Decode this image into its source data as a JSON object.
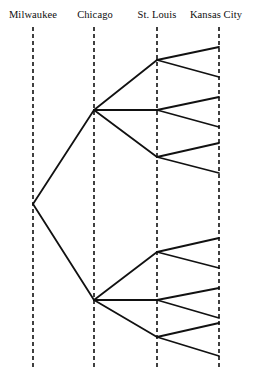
{
  "figure": {
    "type": "tree-diagram",
    "background": "#ffffff",
    "stroke_color": "#111111",
    "width": 254,
    "height": 370
  },
  "columns": [
    {
      "id": "milwaukee",
      "label": "Milwaukee",
      "x": 33,
      "label_x": 33,
      "label_y": 10
    },
    {
      "id": "chicago",
      "label": "Chicago",
      "x": 94,
      "label_x": 95,
      "label_y": 10
    },
    {
      "id": "stlouis",
      "label": "St. Louis",
      "x": 157,
      "label_x": 157,
      "label_y": 10
    },
    {
      "id": "kansascity",
      "label": "Kansas City",
      "x": 219,
      "label_x": 216,
      "label_y": 10
    }
  ],
  "axis_lines": {
    "style": "dashed",
    "y_top": 27,
    "y_bottom": 369,
    "dash": "4 3",
    "width": 1.6,
    "color": "#111111"
  },
  "nodes": {
    "root": [
      {
        "id": "m0",
        "x": 33,
        "y": 204
      }
    ],
    "chicago": [
      {
        "id": "c1",
        "x": 94,
        "y": 110
      },
      {
        "id": "c2",
        "x": 94,
        "y": 300
      }
    ],
    "stlouis": [
      {
        "id": "s1",
        "x": 157,
        "y": 60,
        "parent": "c1"
      },
      {
        "id": "s2",
        "x": 157,
        "y": 110,
        "parent": "c1"
      },
      {
        "id": "s3",
        "x": 157,
        "y": 157,
        "parent": "c1"
      },
      {
        "id": "s4",
        "x": 157,
        "y": 252,
        "parent": "c2"
      },
      {
        "id": "s5",
        "x": 157,
        "y": 300,
        "parent": "c2"
      },
      {
        "id": "s6",
        "x": 157,
        "y": 337,
        "parent": "c2"
      }
    ],
    "kansascity": [
      {
        "id": "k1",
        "x": 219,
        "y": 47,
        "parent": "s1"
      },
      {
        "id": "k2",
        "x": 219,
        "y": 77,
        "parent": "s1"
      },
      {
        "id": "k3",
        "x": 219,
        "y": 97,
        "parent": "s2"
      },
      {
        "id": "k4",
        "x": 219,
        "y": 127,
        "parent": "s2"
      },
      {
        "id": "k5",
        "x": 219,
        "y": 143,
        "parent": "s3"
      },
      {
        "id": "k6",
        "x": 219,
        "y": 173,
        "parent": "s3"
      },
      {
        "id": "k7",
        "x": 219,
        "y": 238,
        "parent": "s4"
      },
      {
        "id": "k8",
        "x": 219,
        "y": 268,
        "parent": "s4"
      },
      {
        "id": "k9",
        "x": 219,
        "y": 288,
        "parent": "s5"
      },
      {
        "id": "k10",
        "x": 219,
        "y": 318,
        "parent": "s5"
      },
      {
        "id": "k11",
        "x": 219,
        "y": 323,
        "parent": "s6"
      },
      {
        "id": "k12",
        "x": 219,
        "y": 356,
        "parent": "s6"
      }
    ]
  },
  "edges": [
    {
      "from": "m0",
      "to": "c1",
      "x1": 33,
      "y1": 204,
      "x2": 94,
      "y2": 110
    },
    {
      "from": "m0",
      "to": "c2",
      "x1": 33,
      "y1": 204,
      "x2": 94,
      "y2": 300
    },
    {
      "from": "c1",
      "to": "s1",
      "x1": 94,
      "y1": 110,
      "x2": 157,
      "y2": 60
    },
    {
      "from": "c1",
      "to": "s2",
      "x1": 94,
      "y1": 110,
      "x2": 157,
      "y2": 110
    },
    {
      "from": "c1",
      "to": "s3",
      "x1": 94,
      "y1": 110,
      "x2": 157,
      "y2": 157
    },
    {
      "from": "c2",
      "to": "s4",
      "x1": 94,
      "y1": 300,
      "x2": 157,
      "y2": 252
    },
    {
      "from": "c2",
      "to": "s5",
      "x1": 94,
      "y1": 300,
      "x2": 157,
      "y2": 300
    },
    {
      "from": "c2",
      "to": "s6",
      "x1": 94,
      "y1": 300,
      "x2": 157,
      "y2": 337
    },
    {
      "from": "s1",
      "to": "k1",
      "x1": 157,
      "y1": 60,
      "x2": 219,
      "y2": 47
    },
    {
      "from": "s1",
      "to": "k2",
      "x1": 157,
      "y1": 60,
      "x2": 219,
      "y2": 77
    },
    {
      "from": "s2",
      "to": "k3",
      "x1": 157,
      "y1": 110,
      "x2": 219,
      "y2": 97
    },
    {
      "from": "s2",
      "to": "k4",
      "x1": 157,
      "y1": 110,
      "x2": 219,
      "y2": 127
    },
    {
      "from": "s3",
      "to": "k5",
      "x1": 157,
      "y1": 157,
      "x2": 219,
      "y2": 143
    },
    {
      "from": "s3",
      "to": "k6",
      "x1": 157,
      "y1": 157,
      "x2": 219,
      "y2": 173
    },
    {
      "from": "s4",
      "to": "k7",
      "x1": 157,
      "y1": 252,
      "x2": 219,
      "y2": 238
    },
    {
      "from": "s4",
      "to": "k8",
      "x1": 157,
      "y1": 252,
      "x2": 219,
      "y2": 268
    },
    {
      "from": "s5",
      "to": "k9",
      "x1": 157,
      "y1": 300,
      "x2": 219,
      "y2": 288
    },
    {
      "from": "s5",
      "to": "k10",
      "x1": 157,
      "y1": 300,
      "x2": 219,
      "y2": 318
    },
    {
      "from": "s6",
      "to": "k11",
      "x1": 157,
      "y1": 337,
      "x2": 219,
      "y2": 323
    },
    {
      "from": "s6",
      "to": "k12",
      "x1": 157,
      "y1": 337,
      "x2": 219,
      "y2": 356
    }
  ]
}
